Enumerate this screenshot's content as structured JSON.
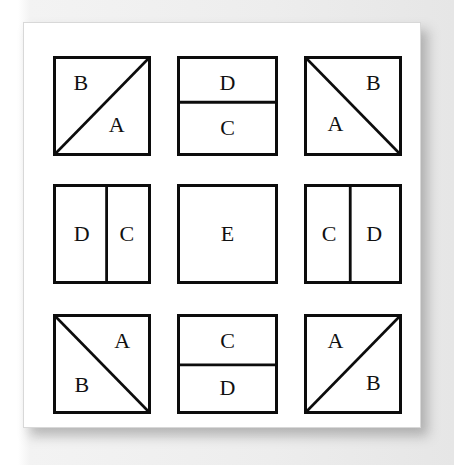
{
  "figure": {
    "kind": "tiling-pattern-grid",
    "rows": 3,
    "cols": 3,
    "ink_color": "#0c0c0c",
    "paper_color": "#ffffff",
    "backdrop_color": "#eeeeee"
  },
  "cells": [
    {
      "id": "cell-1",
      "position": "top-left",
      "split": "diagonal-bl-tr",
      "labels": [
        {
          "text": "B",
          "x": 27,
          "y": 26
        },
        {
          "text": "A",
          "x": 66,
          "y": 70
        }
      ]
    },
    {
      "id": "cell-2",
      "position": "top-center",
      "split": "horizontal",
      "divider_pct": 46,
      "labels": [
        {
          "text": "D",
          "x": 50,
          "y": 25
        },
        {
          "text": "C",
          "x": 50,
          "y": 73
        }
      ]
    },
    {
      "id": "cell-3",
      "position": "top-right",
      "split": "diagonal-tl-br",
      "labels": [
        {
          "text": "B",
          "x": 72,
          "y": 26
        },
        {
          "text": "A",
          "x": 31,
          "y": 69
        }
      ]
    },
    {
      "id": "cell-4",
      "position": "middle-left",
      "split": "vertical",
      "divider_pct": 55,
      "labels": [
        {
          "text": "D",
          "x": 28,
          "y": 50
        },
        {
          "text": "C",
          "x": 77,
          "y": 50
        }
      ]
    },
    {
      "id": "cell-5",
      "position": "middle-center",
      "split": "none",
      "labels": [
        {
          "text": "E",
          "x": 50,
          "y": 50
        }
      ]
    },
    {
      "id": "cell-6",
      "position": "middle-right",
      "split": "vertical",
      "divider_pct": 47,
      "labels": [
        {
          "text": "C",
          "x": 24,
          "y": 50
        },
        {
          "text": "D",
          "x": 73,
          "y": 50
        }
      ]
    },
    {
      "id": "cell-7",
      "position": "bottom-left",
      "split": "diagonal-tl-br",
      "labels": [
        {
          "text": "A",
          "x": 72,
          "y": 26
        },
        {
          "text": "B",
          "x": 28,
          "y": 72
        }
      ]
    },
    {
      "id": "cell-8",
      "position": "bottom-center",
      "split": "horizontal",
      "divider_pct": 51,
      "labels": [
        {
          "text": "C",
          "x": 50,
          "y": 25
        },
        {
          "text": "D",
          "x": 50,
          "y": 76
        }
      ]
    },
    {
      "id": "cell-9",
      "position": "bottom-right",
      "split": "diagonal-bl-tr",
      "labels": [
        {
          "text": "A",
          "x": 31,
          "y": 26
        },
        {
          "text": "B",
          "x": 72,
          "y": 70
        }
      ]
    }
  ]
}
